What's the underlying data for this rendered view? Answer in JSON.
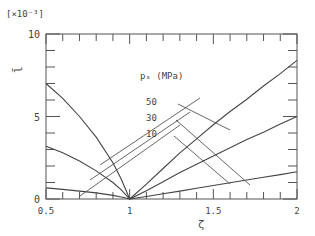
{
  "chart_data": {
    "type": "line",
    "title": "",
    "multiplier_label": "[×10⁻³]",
    "xlabel": "ζ",
    "ylabel": "l̄",
    "xlim": [
      0.5,
      2
    ],
    "ylim": [
      0,
      10
    ],
    "x_ticks": [
      "0.5",
      "1",
      "1.5",
      "2"
    ],
    "x_tick_values": [
      0.5,
      1,
      1.5,
      2
    ],
    "y_ticks": [
      "0",
      "5",
      "10"
    ],
    "y_tick_values": [
      0,
      5,
      10
    ],
    "grid": false,
    "legend": {
      "title": "pₛ (MPa)",
      "position": "center",
      "entries": [
        "50",
        "30",
        "10"
      ]
    },
    "series": [
      {
        "name": "50",
        "x": [
          0.5,
          0.6,
          0.7,
          0.8,
          0.9,
          0.95,
          1.0,
          1.1,
          1.2,
          1.3,
          1.4,
          1.5,
          1.6,
          1.7,
          1.8,
          1.9,
          2.0
        ],
        "values": [
          7.0,
          6.1,
          5.0,
          3.75,
          2.2,
          1.2,
          0.0,
          0.9,
          1.85,
          2.8,
          3.65,
          4.5,
          5.3,
          6.05,
          6.85,
          7.6,
          8.4
        ]
      },
      {
        "name": "30",
        "x": [
          0.5,
          0.6,
          0.7,
          0.8,
          0.9,
          0.95,
          1.0,
          1.1,
          1.2,
          1.3,
          1.4,
          1.5,
          1.6,
          1.7,
          1.8,
          1.9,
          2.0
        ],
        "values": [
          3.2,
          2.8,
          2.3,
          1.7,
          1.0,
          0.55,
          0.0,
          0.5,
          1.05,
          1.6,
          2.1,
          2.6,
          3.1,
          3.6,
          4.05,
          4.55,
          5.0
        ]
      },
      {
        "name": "10",
        "x": [
          0.5,
          0.6,
          0.7,
          0.8,
          0.9,
          0.95,
          1.0,
          1.1,
          1.2,
          1.3,
          1.4,
          1.5,
          1.6,
          1.7,
          1.8,
          1.9,
          2.0
        ],
        "values": [
          0.67,
          0.58,
          0.48,
          0.37,
          0.22,
          0.12,
          0.0,
          0.15,
          0.32,
          0.48,
          0.65,
          0.82,
          0.98,
          1.15,
          1.32,
          1.48,
          1.65
        ]
      }
    ],
    "leader_lines": [
      {
        "label": "50",
        "from": [
          0.78,
          6.0
        ],
        "to": [
          1.12,
          5.9
        ]
      },
      {
        "label": "30",
        "from": [
          0.78,
          4.7
        ],
        "to": [
          1.12,
          4.8
        ]
      },
      {
        "label": "10",
        "from": [
          0.78,
          3.5
        ],
        "to": [
          1.12,
          3.5
        ]
      }
    ]
  }
}
